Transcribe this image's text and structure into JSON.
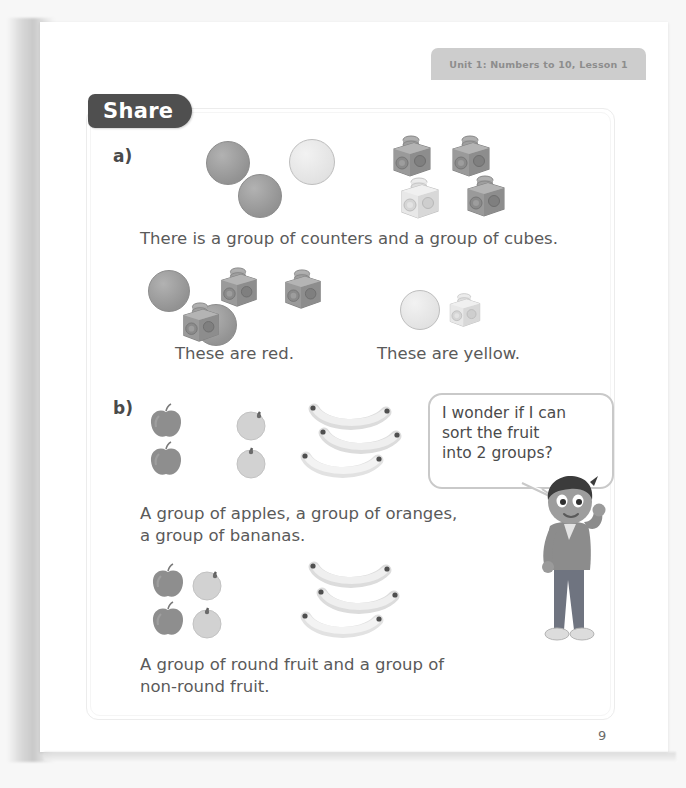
{
  "page": {
    "unit_tab": "Unit 1: Numbers to 10, Lesson 1",
    "section_label": "Share",
    "page_number": "9"
  },
  "parts": {
    "a": {
      "marker": "a)",
      "caption": "There is a group of counters and a group of cubes.",
      "group_red_label": "These are red.",
      "group_yellow_label": "These are yellow.",
      "top_row": {
        "counters": [
          {
            "color_name": "red",
            "hex": "#9a9a9a"
          },
          {
            "color_name": "yellow",
            "hex": "#e6e6e6"
          },
          {
            "color_name": "red",
            "hex": "#9a9a9a"
          }
        ],
        "cubes": [
          {
            "color_name": "red",
            "hex": "#9a9a9a"
          },
          {
            "color_name": "red",
            "hex": "#9a9a9a"
          },
          {
            "color_name": "yellow",
            "hex": "#e6e6e6"
          },
          {
            "color_name": "red",
            "hex": "#9a9a9a"
          }
        ]
      },
      "sorted": {
        "red_group": {
          "counters": 2,
          "cubes": 3
        },
        "yellow_group": {
          "counters": 1,
          "cubes": 1
        }
      }
    },
    "b": {
      "marker": "b)",
      "caption": "A group of apples, a group of oranges,\na group of bananas.",
      "caption2": "A group of round fruit and a group of\nnon-round fruit.",
      "fruit_counts": {
        "apples": 2,
        "oranges": 2,
        "bananas": 3
      },
      "sorted": {
        "round_group": {
          "apples": 2,
          "oranges": 2
        },
        "non_round_group": {
          "bananas": 3
        }
      },
      "speech_bubble": "I wonder if I can\nsort the fruit\ninto 2 groups?"
    }
  },
  "colors": {
    "share_pill": "#4f4f4f",
    "tab": "#cdcdcd",
    "frame_border": "#ececec",
    "text": "#5a5a5a",
    "apple": "#8e8e8e",
    "orange": "#cfcfcf",
    "banana": "#ededed"
  }
}
